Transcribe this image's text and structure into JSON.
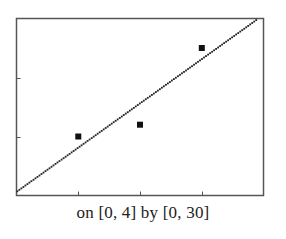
{
  "chart_data": {
    "type": "scatter",
    "title": "",
    "caption": "on [0, 4] by [0, 30]",
    "xlabel": "",
    "ylabel": "",
    "xlim": [
      0,
      4
    ],
    "ylim": [
      0,
      30
    ],
    "xticks": [
      1,
      2,
      3
    ],
    "yticks": [
      10,
      20
    ],
    "grid": false,
    "legend": null,
    "series": [
      {
        "name": "data points",
        "kind": "scatter",
        "marker": "square",
        "x": [
          1,
          2,
          3
        ],
        "y": [
          10,
          12,
          25
        ]
      },
      {
        "name": "regression line",
        "kind": "line",
        "style": "jagged-pixel",
        "slope": 7.5,
        "intercept": 0.7,
        "x": [
          0,
          3.9
        ],
        "y": [
          0.7,
          29.95
        ]
      }
    ]
  },
  "colors": {
    "frame": "#555555",
    "line": "#222222",
    "marker": "#111111",
    "caption": "#222222"
  }
}
